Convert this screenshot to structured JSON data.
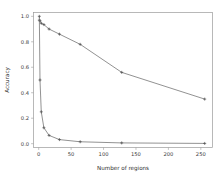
{
  "chart_data": {
    "type": "line",
    "title": "",
    "xlabel": "Number of regions",
    "ylabel": "Accuracy",
    "xlim": [
      -8,
      268
    ],
    "ylim": [
      -0.03,
      1.03
    ],
    "grid": false,
    "legend": "none",
    "x_ticks": [
      0,
      50,
      100,
      150,
      200,
      250
    ],
    "x_tick_labels": [
      "0",
      "50",
      "100",
      "150",
      "200",
      "250"
    ],
    "y_ticks": [
      0.0,
      0.2,
      0.4,
      0.6,
      0.8,
      1.0
    ],
    "y_tick_labels": [
      "0.0",
      "0.2",
      "0.4",
      "0.6",
      "0.8",
      "1.0"
    ],
    "x": [
      1,
      2,
      4,
      8,
      16,
      32,
      64,
      128,
      256
    ],
    "series": [
      {
        "name": "upper-accuracy-curve",
        "marker": "plus",
        "color": "#6e6e6e",
        "values": [
          0.97,
          0.965,
          0.945,
          0.935,
          0.9,
          0.86,
          0.78,
          0.56,
          0.35
        ]
      },
      {
        "name": "lower-accuracy-curve",
        "marker": "plus",
        "color": "#6e6e6e",
        "values": [
          1.0,
          0.5,
          0.25,
          0.125,
          0.065,
          0.032,
          0.015,
          0.006,
          0.002
        ]
      }
    ],
    "annotations": []
  },
  "axes": {
    "x_axis_name": "Number of regions",
    "y_axis_name": "Accuracy"
  },
  "style": {
    "background": "#ffffff",
    "frame_color": "#9a9a9a",
    "line_color": "#6e6e6e",
    "text_color": "#3a3a3a"
  }
}
